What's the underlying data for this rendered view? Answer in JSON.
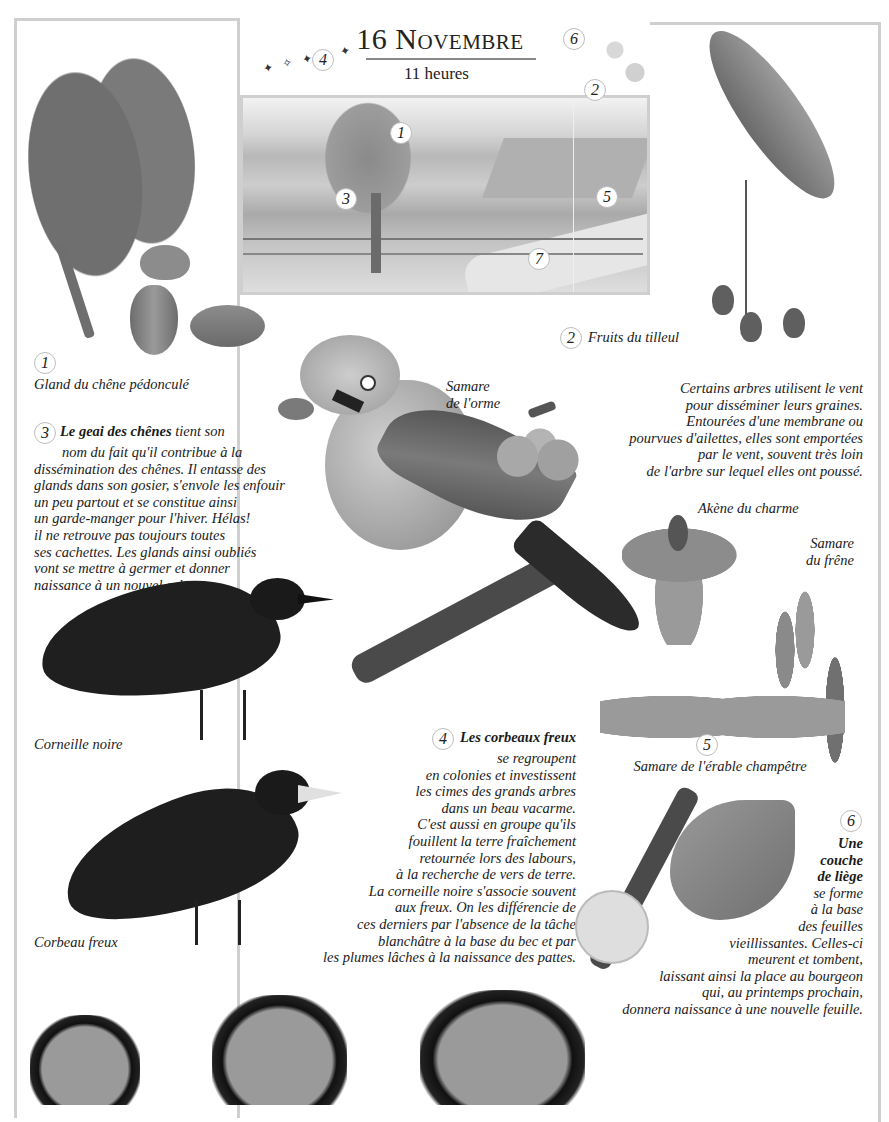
{
  "header": {
    "title_day": "16",
    "title_month": "Novembre",
    "subtitle": "11 heures"
  },
  "landscape": {
    "markers": [
      "1",
      "2",
      "3",
      "4",
      "5",
      "6",
      "7"
    ]
  },
  "captions": {
    "c1": {
      "num": "1",
      "text": "Gland du chêne pédonculé"
    },
    "c2": {
      "num": "2",
      "text": "Fruits du tilleul"
    },
    "elm": [
      "Samare",
      "de l'orme"
    ],
    "hornbeam": "Akène du charme",
    "ash": [
      "Samare",
      "du frêne"
    ],
    "c5": {
      "num": "5",
      "text": "Samare de l'érable champêtre"
    },
    "crow": "Corneille noire",
    "rook": "Corbeau freux"
  },
  "wind_text": [
    "Certains arbres utilisent le vent",
    "pour disséminer leurs graines.",
    "Entourées d'une membrane ou",
    "pourvues d'ailettes, elles sont emportées",
    "par le vent, souvent très loin",
    "de l'arbre sur lequel elles ont poussé."
  ],
  "jay_text": {
    "num": "3",
    "bold": "Le geai des chênes",
    "lines": [
      " tient son",
      "nom du fait qu'il contribue à la",
      "dissémination des chênes. Il entasse des",
      "glands dans son gosier, s'envole les enfouir",
      "un peu partout et se constitue ainsi",
      "un garde-manger pour l'hiver. Hélas!",
      "il ne retrouve pas toujours toutes",
      "ses cachettes. Les glands ainsi oubliés",
      "vont se mettre à germer et donner",
      "naissance à un nouvel arbre."
    ]
  },
  "rook_text": {
    "num": "4",
    "bold": "Les corbeaux freux",
    "lines": [
      "se regroupent",
      "en colonies et investissent",
      "les cimes des grands arbres",
      "dans un beau vacarme.",
      "C'est aussi en groupe qu'ils",
      "fouillent la terre fraîchement",
      "retournée lors des labours,",
      "à la recherche de vers de terre.",
      "La corneille noire s'associe souvent",
      "aux freux. On les différencie de",
      "ces derniers par l'absence de la tâche",
      "blanchâtre à la base du bec et par",
      "les plumes lâches à la naissance des pattes."
    ]
  },
  "cork_text": {
    "num": "6",
    "bold_lines": [
      "Une",
      "couche",
      "de liège"
    ],
    "lines": [
      "se forme",
      "à la base",
      "des feuilles",
      "vieillissantes. Celles-ci",
      "meurent et tombent,",
      "laissant ainsi la place au bourgeon",
      "qui, au printemps prochain,",
      "donnera naissance à une nouvelle feuille."
    ]
  }
}
